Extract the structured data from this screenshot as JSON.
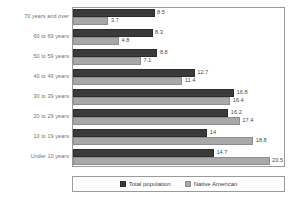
{
  "chart_data": {
    "type": "bar",
    "orientation": "horizontal",
    "grouped": true,
    "title": "",
    "subtitle": "",
    "xlabel": "",
    "ylabel": "",
    "xlim": [
      0,
      22
    ],
    "grid": false,
    "legend_position": "bottom",
    "categories": [
      "70 years and over",
      "60 to 69 years",
      "50 to 59 years",
      "40 to 49 years",
      "30 to 39 years",
      "20 to 29 years",
      "10 to 19 years",
      "Under 10 years"
    ],
    "series": [
      {
        "name": "Total population",
        "color": "#3a3a3a",
        "values": [
          8.5,
          8.3,
          8.8,
          12.7,
          16.8,
          16.2,
          14,
          14.7
        ],
        "labels": [
          "8.5",
          "8.3",
          "8.8",
          "12.7",
          "16.8",
          "16.2",
          "14",
          "14.7"
        ]
      },
      {
        "name": "Native American",
        "color": "#a8a8a8",
        "values": [
          3.7,
          4.8,
          7.1,
          11.4,
          16.4,
          17.4,
          18.8,
          20.5
        ],
        "labels": [
          "3.7",
          "4.8",
          "7.1",
          "11.4",
          "16.4",
          "17.4",
          "18.8",
          "20.5"
        ]
      }
    ]
  },
  "legend": {
    "items": [
      {
        "label": "Total population"
      },
      {
        "label": "Native American"
      }
    ]
  }
}
